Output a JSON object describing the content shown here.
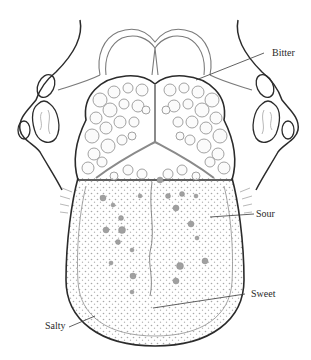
{
  "diagram": {
    "colors": {
      "outline": "#2b2b2b",
      "inner_line": "#8a8a8a",
      "papillae": "#9a9a9a",
      "background": "#ffffff"
    },
    "labels": [
      {
        "id": "bitter",
        "text": "Bitter",
        "x": 272,
        "y": 48,
        "leader": [
          264,
          53,
          196,
          80
        ]
      },
      {
        "id": "sour",
        "text": "Sour",
        "x": 256,
        "y": 209,
        "leader": [
          254,
          214,
          210,
          217
        ]
      },
      {
        "id": "sweet",
        "text": "Sweet",
        "x": 251,
        "y": 289,
        "leader": [
          245,
          294,
          153,
          308
        ]
      },
      {
        "id": "salty",
        "text": "Salty",
        "x": 45,
        "y": 321,
        "leader": [
          69,
          327,
          95,
          316
        ]
      }
    ]
  }
}
